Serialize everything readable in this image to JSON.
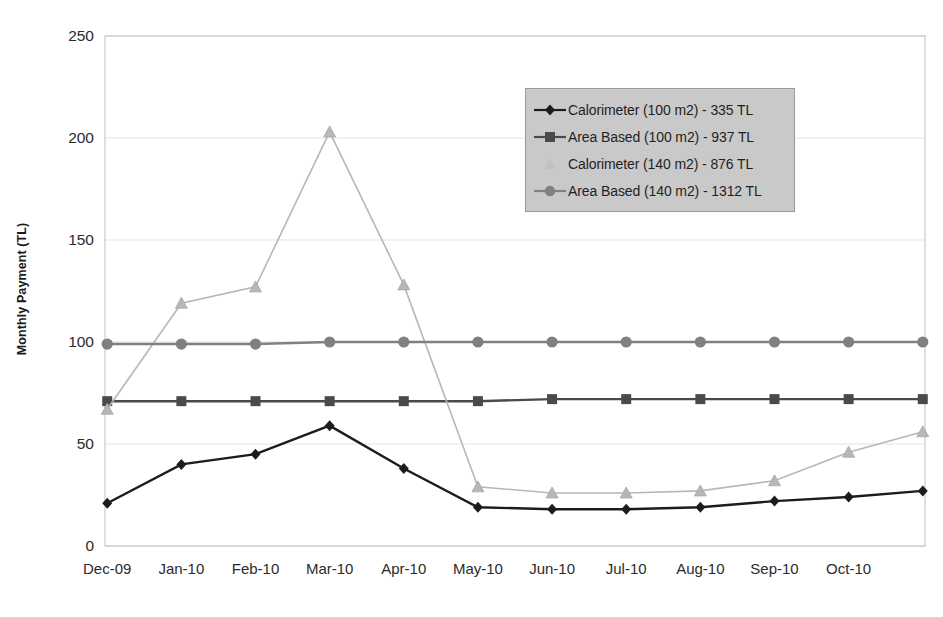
{
  "chart_data": {
    "type": "line",
    "title": "",
    "xlabel": "",
    "ylabel": "Monthly Payment (TL)",
    "ylim": [
      0,
      250
    ],
    "yticks": [
      0,
      50,
      100,
      150,
      200,
      250
    ],
    "grid": true,
    "legend_position": "upper-right",
    "categories": [
      "Dec-09",
      "Jan-10",
      "Feb-10",
      "Mar-10",
      "Apr-10",
      "May-10",
      "Jun-10",
      "Jul-10",
      "Aug-10",
      "Sep-10",
      "Oct-10",
      ""
    ],
    "x_tick_labels": [
      "Dec-09",
      "Jan-10",
      "Feb-10",
      "Mar-10",
      "Apr-10",
      "May-10",
      "Jun-10",
      "Jul-10",
      "Aug-10",
      "Sep-10",
      "Oct-10"
    ],
    "series": [
      {
        "name": "Calorimeter (100 m2) - 335 TL",
        "marker": "diamond",
        "color": "#1c1c1c",
        "values": [
          21,
          40,
          45,
          59,
          38,
          19,
          18,
          18,
          19,
          22,
          24,
          27
        ]
      },
      {
        "name": "Area Based (100 m2) - 937 TL",
        "marker": "square",
        "color": "#4a4a4a",
        "values": [
          71,
          71,
          71,
          71,
          71,
          71,
          72,
          72,
          72,
          72,
          72,
          72
        ]
      },
      {
        "name": "Calorimeter (140 m2) - 876 TL",
        "marker": "triangle",
        "color": "#b7b7b7",
        "values": [
          67,
          119,
          127,
          203,
          128,
          29,
          26,
          26,
          27,
          32,
          46,
          56
        ]
      },
      {
        "name": "Area Based (140 m2) - 1312 TL",
        "marker": "circle",
        "color": "#808080",
        "values": [
          99,
          99,
          99,
          100,
          100,
          100,
          100,
          100,
          100,
          100,
          100,
          100
        ]
      }
    ]
  },
  "legend": {
    "items": [
      {
        "label": "Calorimeter (100 m2) - 335 TL",
        "marker": "diamond",
        "color": "#1c1c1c"
      },
      {
        "label": "Area Based (100 m2) - 937 TL",
        "marker": "square",
        "color": "#4a4a4a"
      },
      {
        "label": "Calorimeter (140 m2) - 876 TL",
        "marker": "triangle",
        "color": "#c2c2c2"
      },
      {
        "label": "Area Based (140 m2) - 1312 TL",
        "marker": "circle",
        "color": "#808080"
      }
    ]
  },
  "colors": {
    "background": "#ffffff",
    "grid": "#e3e3e3",
    "axis": "#bfbfbf",
    "legend_fill": "#c9c9c9",
    "legend_border": "#9a9a9a",
    "text": "#2b2b2b"
  }
}
